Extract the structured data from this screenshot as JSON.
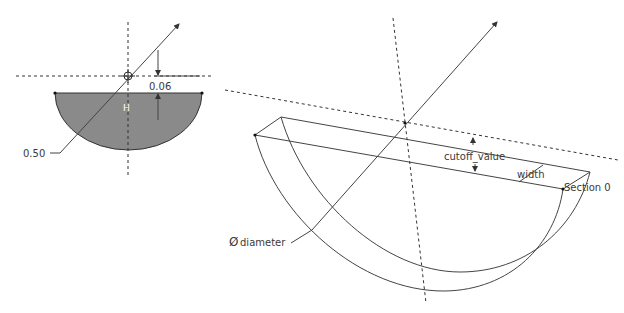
{
  "left_view": {
    "title": "2D section sketch",
    "fill_color": "#8a8a8a",
    "labels": {
      "offset_dim": "0.06",
      "radius_dim": "0.50",
      "constraint_symbol": "H"
    }
  },
  "right_view": {
    "title": "3D isometric view",
    "labels": {
      "cutoff": "cutoff_value",
      "width": "width",
      "diameter_symbol": "Ø",
      "diameter": "diameter",
      "section": "Section 0"
    }
  }
}
